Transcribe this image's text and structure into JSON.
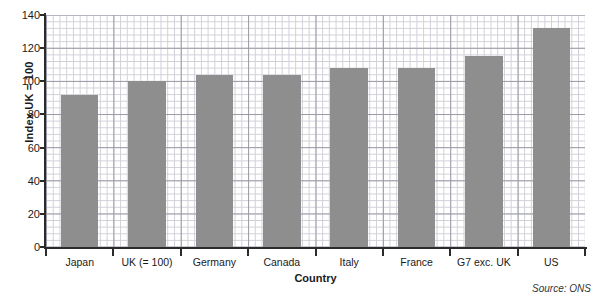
{
  "chart_data": {
    "type": "bar",
    "title": "",
    "xlabel": "Country",
    "ylabel": "Index UK = 100",
    "categories": [
      "Japan",
      "UK (= 100)",
      "Germany",
      "Canada",
      "Italy",
      "France",
      "G7 exc. UK",
      "US"
    ],
    "values": [
      92,
      100,
      104,
      104,
      108,
      108,
      115,
      132
    ],
    "ylim": [
      0,
      140
    ],
    "yticks": [
      0,
      20,
      40,
      60,
      80,
      100,
      120,
      140
    ],
    "ytick_labels": [
      "0",
      "20",
      "40",
      "60",
      "80",
      "100",
      "120",
      "140"
    ],
    "grid": true,
    "grid_minor": true,
    "legend": "none",
    "bar_color": "#8e8e8e",
    "axis_color": "#2b2b2b",
    "grid_major_color": "#9a9aa6",
    "grid_minor_color": "#c9c9d2",
    "annotations": {
      "source": "Source: ONS"
    }
  }
}
